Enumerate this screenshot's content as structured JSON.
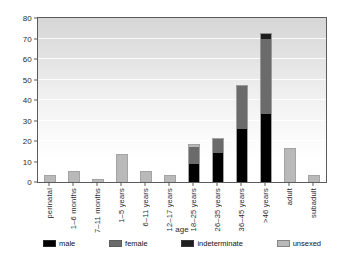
{
  "chart_data": {
    "type": "bar",
    "stacked": true,
    "title": "",
    "xlabel": "age",
    "ylabel": "",
    "ylim": [
      0,
      80
    ],
    "ytick_values": [
      0,
      10,
      20,
      30,
      40,
      50,
      60,
      70,
      80
    ],
    "ytick_labels": [
      "0",
      "10",
      "20",
      "30",
      "40",
      "50",
      "60",
      "70",
      "80"
    ],
    "grid": true,
    "legend_position": "bottom",
    "categories": [
      "perinatal",
      "1–6 months",
      "7–11 months",
      "1–5 years",
      "6–11 years",
      "12–17 years",
      "18–25 years",
      "26–35 years",
      "36–45 years",
      ">46 years",
      "adult",
      "subadult"
    ],
    "series": [
      {
        "name": "male",
        "color": "#000000",
        "values": [
          0,
          0,
          0,
          0,
          0,
          0,
          9,
          14,
          26,
          33,
          0,
          0
        ]
      },
      {
        "name": "female",
        "color": "#6b6b6b",
        "values": [
          0,
          0,
          0,
          0,
          0,
          0,
          8,
          7,
          21,
          37,
          0,
          0
        ]
      },
      {
        "name": "indeterminate",
        "color": "#1e1e1e",
        "values": [
          0,
          0,
          0,
          0,
          0,
          0,
          0,
          0,
          0,
          2,
          0,
          0
        ]
      },
      {
        "name": "unsexed",
        "color": "#b9b9b9",
        "values": [
          3,
          5,
          1,
          13,
          5,
          3,
          1,
          0,
          0,
          0,
          16,
          3
        ]
      }
    ],
    "totals": [
      3,
      5,
      1,
      13,
      5,
      3,
      18,
      21,
      47,
      72,
      16,
      3
    ]
  },
  "legend": {
    "items": [
      {
        "label": "male"
      },
      {
        "label": "female"
      },
      {
        "label": "indeterminate"
      },
      {
        "label": "unsexed"
      }
    ]
  },
  "colors": {
    "male": "#000000",
    "female": "#6b6b6b",
    "indeterminate": "#1e1e1e",
    "unsexed": "#b9b9b9",
    "axis": "#5a5a5a",
    "background": "#ffffff"
  }
}
